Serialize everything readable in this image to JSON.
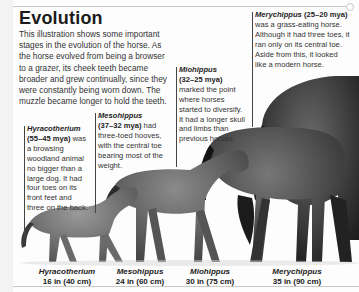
{
  "title": "Evolution",
  "intro": "This illustration shows some important stages in the evolution of the horse. As the horse evolved from being a browser to a grazer, its cheek teeth became broader and grew continually, since they were constantly being worn down. The muzzle became longer to hold the teeth.",
  "species": [
    {
      "name": "Hyracotherium",
      "date": "(55–45 mya)",
      "description": "was a browsing woodland animal no bigger than a large dog. It had four toes on its front feet and three on the back.",
      "label_name": "Hyracotherium",
      "label_size": "16 in (40 cm)"
    },
    {
      "name": "Mesohippus",
      "date": "(37–32 mya)",
      "description": "had three-toed hooves, with the central toe bearing most of the weight.",
      "label_name": "Mesohippus",
      "label_size": "24 in (60 cm)"
    },
    {
      "name": "Miohippus",
      "date": "(32–25 mya)",
      "description": "marked the point where horses started to diversify. It had a longer skull and limbs than previous horses.",
      "label_name": "Miohippus",
      "label_size": "30 in (75 cm)"
    },
    {
      "name": "Merychippus",
      "date": "(25–20 mya)",
      "description": "was a grass-eating horse. Although it had three toes, it ran only on its central toe. Aside from this, it looked like a modern horse.",
      "label_name": "Merychippus",
      "label_size": "35 in (90 cm)"
    }
  ],
  "colors": {
    "page": "#fdfdfd",
    "text": "#333333",
    "horse_dark": "#2a2a2a",
    "horse_mid": "#5a5a5a"
  }
}
